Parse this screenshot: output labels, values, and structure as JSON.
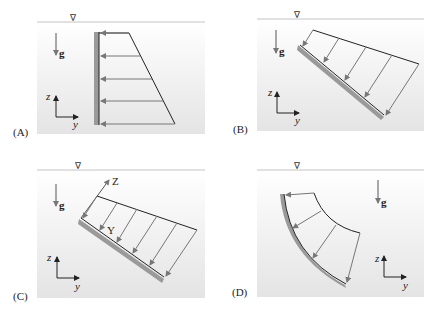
{
  "figure": {
    "colors": {
      "water_top": "#ffffff",
      "water_bottom": "#e6e6e6",
      "surface_line": "#bdbdbd",
      "wall": "#9a9a9a",
      "arrow": "#777777",
      "outline": "#222222"
    },
    "free_surface_symbol": "∇",
    "gravity_label": "g",
    "panels": [
      {
        "id": "A",
        "label": "(A)",
        "axis_z": "z",
        "axis_y": "y",
        "surface_type": "vertical plane"
      },
      {
        "id": "B",
        "label": "(B)",
        "axis_z": "z",
        "axis_y": "y",
        "surface_type": "inclined plane"
      },
      {
        "id": "C",
        "label": "(C)",
        "axis_z": "z",
        "axis_y": "y",
        "local_axis_Z": "Z",
        "local_axis_Y": "Y",
        "surface_type": "inclined plane with local axes"
      },
      {
        "id": "D",
        "label": "(D)",
        "axis_z": "z",
        "axis_y": "y",
        "surface_type": "curved surface"
      }
    ]
  }
}
